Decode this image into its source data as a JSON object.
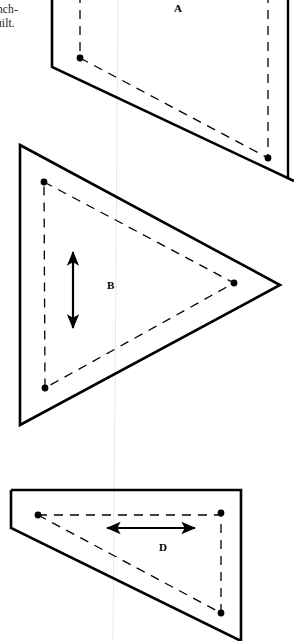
{
  "page": {
    "width": 294,
    "height": 641,
    "background_color": "#ffffff",
    "ink_color": "#000000",
    "fold_line_color": "#e8e8e4"
  },
  "text_fragments": [
    {
      "name": "text-fragment-inch",
      "text": "nch-"
    },
    {
      "name": "text-fragment-quilt",
      "text": "uilt."
    }
  ],
  "labels": {
    "piece_a": "A",
    "piece_b": "B",
    "piece_d": "D"
  },
  "pieces": [
    {
      "id": "A",
      "label": "A",
      "shape": "quadrilateral",
      "description": "Template piece A, top of page, cropped at top edge",
      "cut_line_points": "52,-6 52,67 294,181",
      "right_edge_points": "288,-6 288,178",
      "seam_line_points": "80,58 268,158",
      "seam_vertical_left": "80,-6 80,58",
      "seam_vertical_right": "268,-6 268,158",
      "dots": [
        {
          "cx": 80,
          "cy": 58
        },
        {
          "cx": 268,
          "cy": 158
        }
      ],
      "label_position": {
        "x": 174,
        "y": 2
      },
      "arrow": null
    },
    {
      "id": "B",
      "label": "B",
      "shape": "triangle",
      "description": "Template piece B, right-pointing triangle",
      "cut_line_points": "20,145 280,285 20,425",
      "seam_line_points": "44,182 234,283 45,388",
      "dots": [
        {
          "cx": 44,
          "cy": 182
        },
        {
          "cx": 234,
          "cy": 283
        },
        {
          "cx": 45,
          "cy": 388
        }
      ],
      "label_position": {
        "x": 107,
        "y": 279
      },
      "arrow": {
        "orientation": "vertical",
        "double_headed": true,
        "x1": 73,
        "y1": 250,
        "x2": 73,
        "y2": 330
      }
    },
    {
      "id": "D",
      "label": "D",
      "shape": "pentagon",
      "description": "Template piece D, right triangle with clipped top-left corner",
      "cut_line_points": "11,490 241,490 241,641 11,528 11,490",
      "clip_corner_points": "11,518 24,531",
      "seam_line_points": "38,515 221,515 221,613",
      "seam_diagonal_points": "38,515 221,613",
      "dots": [
        {
          "cx": 38,
          "cy": 515
        },
        {
          "cx": 221,
          "cy": 513
        },
        {
          "cx": 221,
          "cy": 613
        }
      ],
      "label_position": {
        "x": 159,
        "y": 541
      },
      "arrow": {
        "orientation": "horizontal",
        "double_headed": true,
        "x1": 105,
        "y1": 528,
        "x2": 197,
        "y2": 528
      }
    }
  ],
  "fold_line": {
    "name": "page-fold-line",
    "points": "118,0 113,641"
  },
  "line_styles": {
    "cut_line_width": 2.6,
    "seam_line_width": 1.3,
    "seam_dash_pattern": "9 7",
    "dot_radius": 3.4,
    "arrow_line_width": 2.2
  }
}
